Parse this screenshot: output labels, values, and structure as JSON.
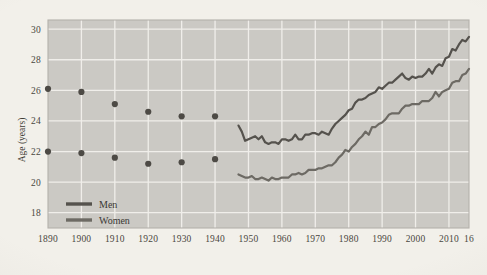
{
  "chart_data": {
    "type": "line",
    "title": "",
    "subtitle": "",
    "xlabel": "",
    "ylabel": "Age (years)",
    "xlim": [
      1890,
      2016
    ],
    "ylim": [
      17,
      30.6
    ],
    "grid": true,
    "legend_position": "bottom-left-inside",
    "x_ticks": [
      1890,
      1900,
      1910,
      1920,
      1930,
      1940,
      1950,
      1960,
      1970,
      1980,
      1990,
      2000,
      2010,
      2016
    ],
    "x_tick_labels": [
      "1890",
      "1900",
      "1910",
      "1920",
      "1930",
      "1940",
      "1950",
      "1960",
      "1970",
      "1980",
      "1990",
      "2000",
      "2010",
      "16"
    ],
    "y_ticks": [
      18,
      20,
      22,
      24,
      26,
      28,
      30
    ],
    "y_tick_labels": [
      "18",
      "20",
      "22",
      "24",
      "26",
      "28",
      "30"
    ],
    "series": [
      {
        "name": "Men",
        "legend_label": "Men",
        "color": "#55524d",
        "marker_style": "circle",
        "line_style": "solid",
        "scatter_points": [
          {
            "x": 1890,
            "y": 26.1
          },
          {
            "x": 1900,
            "y": 25.9
          },
          {
            "x": 1910,
            "y": 25.1
          },
          {
            "x": 1920,
            "y": 24.6
          },
          {
            "x": 1930,
            "y": 24.3
          },
          {
            "x": 1940,
            "y": 24.3
          }
        ],
        "line_points": [
          {
            "x": 1947,
            "y": 23.7
          },
          {
            "x": 1948,
            "y": 23.3
          },
          {
            "x": 1949,
            "y": 22.7
          },
          {
            "x": 1950,
            "y": 22.8
          },
          {
            "x": 1951,
            "y": 22.9
          },
          {
            "x": 1952,
            "y": 23.0
          },
          {
            "x": 1953,
            "y": 22.8
          },
          {
            "x": 1954,
            "y": 23.0
          },
          {
            "x": 1955,
            "y": 22.6
          },
          {
            "x": 1956,
            "y": 22.5
          },
          {
            "x": 1957,
            "y": 22.6
          },
          {
            "x": 1958,
            "y": 22.6
          },
          {
            "x": 1959,
            "y": 22.5
          },
          {
            "x": 1960,
            "y": 22.8
          },
          {
            "x": 1961,
            "y": 22.8
          },
          {
            "x": 1962,
            "y": 22.7
          },
          {
            "x": 1963,
            "y": 22.8
          },
          {
            "x": 1964,
            "y": 23.1
          },
          {
            "x": 1965,
            "y": 22.8
          },
          {
            "x": 1966,
            "y": 22.8
          },
          {
            "x": 1967,
            "y": 23.1
          },
          {
            "x": 1968,
            "y": 23.1
          },
          {
            "x": 1969,
            "y": 23.2
          },
          {
            "x": 1970,
            "y": 23.2
          },
          {
            "x": 1971,
            "y": 23.1
          },
          {
            "x": 1972,
            "y": 23.3
          },
          {
            "x": 1973,
            "y": 23.2
          },
          {
            "x": 1974,
            "y": 23.1
          },
          {
            "x": 1975,
            "y": 23.5
          },
          {
            "x": 1976,
            "y": 23.8
          },
          {
            "x": 1977,
            "y": 24.0
          },
          {
            "x": 1978,
            "y": 24.2
          },
          {
            "x": 1979,
            "y": 24.4
          },
          {
            "x": 1980,
            "y": 24.7
          },
          {
            "x": 1981,
            "y": 24.8
          },
          {
            "x": 1982,
            "y": 25.2
          },
          {
            "x": 1983,
            "y": 25.4
          },
          {
            "x": 1984,
            "y": 25.4
          },
          {
            "x": 1985,
            "y": 25.5
          },
          {
            "x": 1986,
            "y": 25.7
          },
          {
            "x": 1987,
            "y": 25.8
          },
          {
            "x": 1988,
            "y": 25.9
          },
          {
            "x": 1989,
            "y": 26.2
          },
          {
            "x": 1990,
            "y": 26.1
          },
          {
            "x": 1991,
            "y": 26.3
          },
          {
            "x": 1992,
            "y": 26.5
          },
          {
            "x": 1993,
            "y": 26.5
          },
          {
            "x": 1994,
            "y": 26.7
          },
          {
            "x": 1995,
            "y": 26.9
          },
          {
            "x": 1996,
            "y": 27.1
          },
          {
            "x": 1997,
            "y": 26.8
          },
          {
            "x": 1998,
            "y": 26.7
          },
          {
            "x": 1999,
            "y": 26.9
          },
          {
            "x": 2000,
            "y": 26.8
          },
          {
            "x": 2001,
            "y": 26.9
          },
          {
            "x": 2002,
            "y": 26.9
          },
          {
            "x": 2003,
            "y": 27.1
          },
          {
            "x": 2004,
            "y": 27.4
          },
          {
            "x": 2005,
            "y": 27.1
          },
          {
            "x": 2006,
            "y": 27.5
          },
          {
            "x": 2007,
            "y": 27.7
          },
          {
            "x": 2008,
            "y": 27.6
          },
          {
            "x": 2009,
            "y": 28.1
          },
          {
            "x": 2010,
            "y": 28.2
          },
          {
            "x": 2011,
            "y": 28.7
          },
          {
            "x": 2012,
            "y": 28.6
          },
          {
            "x": 2013,
            "y": 29.0
          },
          {
            "x": 2014,
            "y": 29.3
          },
          {
            "x": 2015,
            "y": 29.2
          },
          {
            "x": 2016,
            "y": 29.5
          }
        ]
      },
      {
        "name": "Women",
        "legend_label": "Women",
        "color": "#6d6a64",
        "marker_style": "circle",
        "line_style": "solid",
        "scatter_points": [
          {
            "x": 1890,
            "y": 22.0
          },
          {
            "x": 1900,
            "y": 21.9
          },
          {
            "x": 1910,
            "y": 21.6
          },
          {
            "x": 1920,
            "y": 21.2
          },
          {
            "x": 1930,
            "y": 21.3
          },
          {
            "x": 1940,
            "y": 21.5
          }
        ],
        "line_points": [
          {
            "x": 1947,
            "y": 20.5
          },
          {
            "x": 1948,
            "y": 20.4
          },
          {
            "x": 1949,
            "y": 20.3
          },
          {
            "x": 1950,
            "y": 20.3
          },
          {
            "x": 1951,
            "y": 20.4
          },
          {
            "x": 1952,
            "y": 20.2
          },
          {
            "x": 1953,
            "y": 20.2
          },
          {
            "x": 1954,
            "y": 20.3
          },
          {
            "x": 1955,
            "y": 20.2
          },
          {
            "x": 1956,
            "y": 20.1
          },
          {
            "x": 1957,
            "y": 20.3
          },
          {
            "x": 1958,
            "y": 20.2
          },
          {
            "x": 1959,
            "y": 20.2
          },
          {
            "x": 1960,
            "y": 20.3
          },
          {
            "x": 1961,
            "y": 20.3
          },
          {
            "x": 1962,
            "y": 20.3
          },
          {
            "x": 1963,
            "y": 20.5
          },
          {
            "x": 1964,
            "y": 20.5
          },
          {
            "x": 1965,
            "y": 20.6
          },
          {
            "x": 1966,
            "y": 20.5
          },
          {
            "x": 1967,
            "y": 20.6
          },
          {
            "x": 1968,
            "y": 20.8
          },
          {
            "x": 1969,
            "y": 20.8
          },
          {
            "x": 1970,
            "y": 20.8
          },
          {
            "x": 1971,
            "y": 20.9
          },
          {
            "x": 1972,
            "y": 20.9
          },
          {
            "x": 1973,
            "y": 21.0
          },
          {
            "x": 1974,
            "y": 21.1
          },
          {
            "x": 1975,
            "y": 21.1
          },
          {
            "x": 1976,
            "y": 21.3
          },
          {
            "x": 1977,
            "y": 21.6
          },
          {
            "x": 1978,
            "y": 21.8
          },
          {
            "x": 1979,
            "y": 22.1
          },
          {
            "x": 1980,
            "y": 22.0
          },
          {
            "x": 1981,
            "y": 22.3
          },
          {
            "x": 1982,
            "y": 22.5
          },
          {
            "x": 1983,
            "y": 22.8
          },
          {
            "x": 1984,
            "y": 23.0
          },
          {
            "x": 1985,
            "y": 23.3
          },
          {
            "x": 1986,
            "y": 23.1
          },
          {
            "x": 1987,
            "y": 23.6
          },
          {
            "x": 1988,
            "y": 23.6
          },
          {
            "x": 1989,
            "y": 23.8
          },
          {
            "x": 1990,
            "y": 23.9
          },
          {
            "x": 1991,
            "y": 24.1
          },
          {
            "x": 1992,
            "y": 24.4
          },
          {
            "x": 1993,
            "y": 24.5
          },
          {
            "x": 1994,
            "y": 24.5
          },
          {
            "x": 1995,
            "y": 24.5
          },
          {
            "x": 1996,
            "y": 24.8
          },
          {
            "x": 1997,
            "y": 25.0
          },
          {
            "x": 1998,
            "y": 25.0
          },
          {
            "x": 1999,
            "y": 25.1
          },
          {
            "x": 2000,
            "y": 25.1
          },
          {
            "x": 2001,
            "y": 25.1
          },
          {
            "x": 2002,
            "y": 25.3
          },
          {
            "x": 2003,
            "y": 25.3
          },
          {
            "x": 2004,
            "y": 25.3
          },
          {
            "x": 2005,
            "y": 25.5
          },
          {
            "x": 2006,
            "y": 25.9
          },
          {
            "x": 2007,
            "y": 25.6
          },
          {
            "x": 2008,
            "y": 25.9
          },
          {
            "x": 2009,
            "y": 26.0
          },
          {
            "x": 2010,
            "y": 26.1
          },
          {
            "x": 2011,
            "y": 26.5
          },
          {
            "x": 2012,
            "y": 26.6
          },
          {
            "x": 2013,
            "y": 26.6
          },
          {
            "x": 2014,
            "y": 27.0
          },
          {
            "x": 2015,
            "y": 27.1
          },
          {
            "x": 2016,
            "y": 27.4
          }
        ]
      }
    ]
  },
  "style": {
    "page_background": "#f2f0ea",
    "plot_background": "#cbc9c4",
    "gridline_color": "#f0eeea",
    "border_color": "#b4b1ab",
    "text_color": "#44413b"
  }
}
